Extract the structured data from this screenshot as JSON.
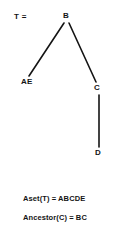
{
  "figure": {
    "tree_name": "T =",
    "background_color": "#ffffff",
    "ink_color": "#141414"
  },
  "tree": {
    "nodes": [
      {
        "id": "B",
        "label": "B",
        "x": 66,
        "y": 16
      },
      {
        "id": "AE",
        "label": "AE",
        "x": 27,
        "y": 82
      },
      {
        "id": "C",
        "label": "C",
        "x": 97,
        "y": 88
      },
      {
        "id": "D",
        "label": "D",
        "x": 98,
        "y": 153
      }
    ],
    "edges": [
      {
        "from": "B",
        "to": "AE",
        "x1": 64,
        "y1": 23,
        "x2": 29,
        "y2": 76
      },
      {
        "from": "B",
        "to": "C",
        "x1": 69,
        "y1": 23,
        "x2": 96,
        "y2": 82
      },
      {
        "from": "C",
        "to": "D",
        "x1": 99,
        "y1": 95,
        "x2": 99,
        "y2": 147
      }
    ]
  },
  "captions": [
    {
      "text": "Aset(T) = ABCDE",
      "x": 23,
      "y": 195
    },
    {
      "text": "Ancestor(C) = BC",
      "x": 23,
      "y": 214
    }
  ]
}
